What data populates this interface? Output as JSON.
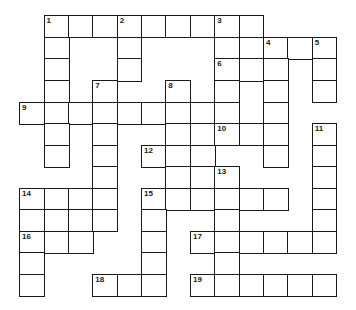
{
  "puzzle": {
    "type": "crossword",
    "grid": {
      "origin": [
        19,
        15
      ],
      "col_lines": [
        19,
        43.5,
        68,
        92.3,
        116.7,
        141,
        165.3,
        190,
        214.3,
        238.7,
        263,
        287.3,
        311.7,
        336
      ],
      "row_lines": [
        15,
        36.5,
        58,
        80,
        101.5,
        123,
        144.5,
        166,
        187.5,
        209,
        230.5,
        252,
        273.5,
        295
      ]
    },
    "rows": [
      [
        1,
        2,
        3,
        4,
        5,
        6,
        7,
        8,
        9
      ],
      [
        1,
        4,
        8,
        9,
        10,
        11,
        12
      ],
      [
        1,
        4,
        8,
        9,
        10,
        12
      ],
      [
        1,
        3,
        6,
        8,
        10,
        12
      ],
      [
        0,
        1,
        2,
        3,
        4,
        5,
        6,
        7,
        8,
        10
      ],
      [
        1,
        3,
        6,
        7,
        8,
        9,
        10,
        12
      ],
      [
        1,
        3,
        5,
        6,
        7,
        10,
        12
      ],
      [
        3,
        6,
        7,
        8,
        12
      ],
      [
        0,
        1,
        2,
        3,
        5,
        6,
        7,
        8,
        9,
        10,
        12
      ],
      [
        0,
        1,
        2,
        3,
        5,
        8,
        12
      ],
      [
        0,
        1,
        2,
        5,
        7,
        8,
        9,
        10,
        11,
        12
      ],
      [
        0,
        5,
        8
      ],
      [
        0,
        3,
        4,
        5,
        7,
        8,
        9,
        10,
        11,
        12
      ]
    ],
    "numbers": [
      {
        "label": "1",
        "row": 0,
        "col": 1
      },
      {
        "label": "2",
        "row": 0,
        "col": 4
      },
      {
        "label": "3",
        "row": 0,
        "col": 8
      },
      {
        "label": "4",
        "row": 1,
        "col": 10
      },
      {
        "label": "5",
        "row": 1,
        "col": 12
      },
      {
        "label": "6",
        "row": 2,
        "col": 8
      },
      {
        "label": "7",
        "row": 3,
        "col": 3
      },
      {
        "label": "8",
        "row": 3,
        "col": 6
      },
      {
        "label": "9",
        "row": 4,
        "col": 0
      },
      {
        "label": "10",
        "row": 5,
        "col": 8
      },
      {
        "label": "11",
        "row": 5,
        "col": 12
      },
      {
        "label": "12",
        "row": 6,
        "col": 5
      },
      {
        "label": "13",
        "row": 7,
        "col": 8
      },
      {
        "label": "14",
        "row": 8,
        "col": 0
      },
      {
        "label": "15",
        "row": 8,
        "col": 5
      },
      {
        "label": "16",
        "row": 10,
        "col": 0
      },
      {
        "label": "17",
        "row": 10,
        "col": 7
      },
      {
        "label": "18",
        "row": 12,
        "col": 3
      },
      {
        "label": "19",
        "row": 12,
        "col": 7
      }
    ],
    "colors": {
      "line": "#1a1a1a",
      "cell": "#ffffff",
      "background": "#ffffff"
    }
  }
}
